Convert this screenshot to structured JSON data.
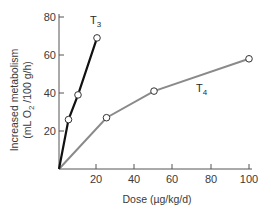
{
  "chart_data": {
    "type": "line",
    "title": "",
    "xlabel": "Dose (µg/kg/d)",
    "ylabel_line1": "Increased metabolism",
    "ylabel_line2_pre": "(mL O",
    "ylabel_line2_sub": "2",
    "ylabel_line2_post": " /100 g/h)",
    "ylabel": "Increased metabolism (mL O2 /100 g/h)",
    "xlim": [
      0,
      100
    ],
    "ylim": [
      0,
      80
    ],
    "xticks": [
      "20",
      "40",
      "60",
      "80",
      "100"
    ],
    "yticks": [
      "20",
      "40",
      "60",
      "80"
    ],
    "grid": false,
    "legend": "inline labels",
    "series": [
      {
        "name": "T3",
        "label_main": "T",
        "label_sub": "3",
        "color": "#111111",
        "x": [
          0,
          5,
          10,
          20
        ],
        "y": [
          0,
          26,
          39,
          69
        ]
      },
      {
        "name": "T4",
        "label_main": "T",
        "label_sub": "4",
        "color": "#8a8a8a",
        "x": [
          0,
          25,
          50,
          100
        ],
        "y": [
          0,
          27,
          41,
          58
        ]
      }
    ]
  }
}
